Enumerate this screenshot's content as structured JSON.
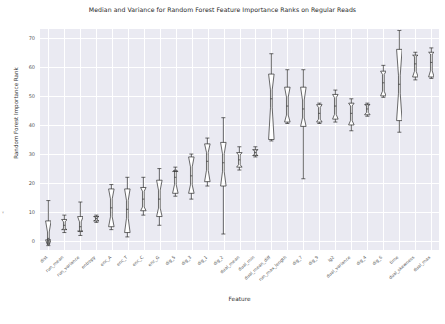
{
  "chart_data": {
    "type": "box",
    "title": "Median and Variance for Random Forest Feature Importance Ranks on Regular Reads",
    "xlabel": "Feature",
    "ylabel": "Random Forest Importance Rank",
    "ylim": [
      -3,
      73
    ],
    "yticks": [
      0,
      10,
      20,
      30,
      40,
      50,
      60,
      70
    ],
    "grid": true,
    "legend": "none",
    "style": "seaborn-darkgrid",
    "notched": true,
    "box_color": "#ffffff",
    "line_color": "#2b2b2b",
    "plot_background": "#eaeaf2",
    "grid_color": "#ffffff",
    "categories": [
      "dist",
      "run_mean",
      "run_variance",
      "entropy",
      "enc_A",
      "enc_T",
      "enc_C",
      "enc_G",
      "dig_5",
      "dig_3",
      "dig_1",
      "dig_2",
      "dual_mean",
      "dual_min",
      "dual_mean_diff",
      "run_max_length",
      "dig_7",
      "dig_9",
      "lg2",
      "dual_variance",
      "dig_4",
      "dig_6",
      "dig_8",
      "time",
      "dual_skewness",
      "dual_max",
      "dual_min2"
    ],
    "boxes": [
      {
        "label": "dist",
        "whisker_low": -1.5,
        "q1": 0.5,
        "median": 1.0,
        "q3": 7.0,
        "whisker_high": 14.0
      },
      {
        "label": "run_mean",
        "whisker_low": 3.0,
        "q1": 4.0,
        "median": 5.5,
        "q3": 7.5,
        "whisker_high": 9.0
      },
      {
        "label": "run_variance",
        "whisker_low": 2.0,
        "q1": 3.5,
        "median": 5.0,
        "q3": 8.5,
        "whisker_high": 13.5
      },
      {
        "label": "entropy",
        "whisker_low": 6.5,
        "q1": 7.0,
        "median": 7.8,
        "q3": 8.5,
        "whisker_high": 9.0
      },
      {
        "label": "enc_A",
        "whisker_low": 4.0,
        "q1": 5.0,
        "median": 11.5,
        "q3": 18.0,
        "whisker_high": 19.5
      },
      {
        "label": "enc_T",
        "whisker_low": 1.5,
        "q1": 3.0,
        "median": 11.0,
        "q3": 18.0,
        "whisker_high": 22.0
      },
      {
        "label": "enc_C",
        "whisker_low": 9.0,
        "q1": 10.5,
        "median": 14.5,
        "q3": 18.5,
        "whisker_high": 22.0
      },
      {
        "label": "enc_G",
        "whisker_low": 5.5,
        "q1": 8.5,
        "median": 14.5,
        "q3": 21.0,
        "whisker_high": 25.0
      },
      {
        "label": "dig_5",
        "whisker_low": 15.5,
        "q1": 16.5,
        "median": 22.0,
        "q3": 24.0,
        "whisker_high": 25.5
      },
      {
        "label": "dig_3",
        "whisker_low": 14.5,
        "q1": 16.5,
        "median": 22.5,
        "q3": 29.0,
        "whisker_high": 30.0
      },
      {
        "label": "dig_1",
        "whisker_low": 19.0,
        "q1": 20.5,
        "median": 27.5,
        "q3": 33.5,
        "whisker_high": 35.5
      },
      {
        "label": "dig_2",
        "whisker_low": 2.5,
        "q1": 19.0,
        "median": 27.0,
        "q3": 34.0,
        "whisker_high": 42.5
      },
      {
        "label": "dual_mean",
        "whisker_low": 24.5,
        "q1": 25.5,
        "median": 28.0,
        "q3": 30.5,
        "whisker_high": 32.5
      },
      {
        "label": "dual_min",
        "whisker_low": 29.0,
        "q1": 29.5,
        "median": 30.5,
        "q3": 31.5,
        "whisker_high": 32.5
      },
      {
        "label": "dual_mean_diff",
        "whisker_low": 34.5,
        "q1": 35.0,
        "median": 49.0,
        "q3": 57.5,
        "whisker_high": 64.5
      },
      {
        "label": "run_max_length",
        "whisker_low": 40.5,
        "q1": 41.0,
        "median": 46.5,
        "q3": 53.0,
        "whisker_high": 59.0
      },
      {
        "label": "dig_7",
        "whisker_low": 21.5,
        "q1": 39.5,
        "median": 45.5,
        "q3": 53.0,
        "whisker_high": 59.0
      },
      {
        "label": "dig_9",
        "whisker_low": 40.5,
        "q1": 41.0,
        "median": 44.0,
        "q3": 47.0,
        "whisker_high": 47.5
      },
      {
        "label": "lg2",
        "whisker_low": 41.0,
        "q1": 42.0,
        "median": 46.5,
        "q3": 50.5,
        "whisker_high": 52.0
      },
      {
        "label": "dual_variance",
        "whisker_low": 38.0,
        "q1": 40.0,
        "median": 44.0,
        "q3": 47.5,
        "whisker_high": 49.0
      },
      {
        "label": "dig_4",
        "whisker_low": 43.0,
        "q1": 43.5,
        "median": 45.5,
        "q3": 47.0,
        "whisker_high": 47.5
      },
      {
        "label": "dig_6",
        "whisker_low": 49.5,
        "q1": 50.0,
        "median": 54.5,
        "q3": 58.5,
        "whisker_high": 60.5
      },
      {
        "label": "time",
        "whisker_low": 37.5,
        "q1": 41.5,
        "median": 54.0,
        "q3": 66.0,
        "whisker_high": 72.5
      },
      {
        "label": "dual_skewness",
        "whisker_low": 55.5,
        "q1": 56.5,
        "median": 61.0,
        "q3": 64.0,
        "whisker_high": 65.0
      },
      {
        "label": "dual_max",
        "whisker_low": 56.0,
        "q1": 56.5,
        "median": 61.5,
        "q3": 65.0,
        "whisker_high": 66.5
      }
    ]
  }
}
